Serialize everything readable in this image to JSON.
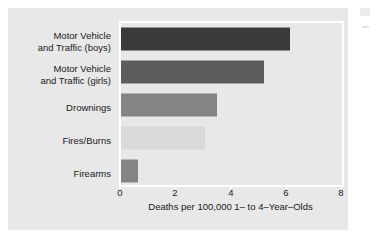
{
  "chart_data": {
    "type": "bar",
    "orientation": "horizontal",
    "title": "",
    "subtitle": "",
    "xlabel": "Deaths per 100,000 1– to 4–Year–Olds",
    "ylabel": "",
    "xlim": [
      0,
      8
    ],
    "xticks": [
      0,
      2,
      4,
      6,
      8
    ],
    "xtick_labels": [
      "0",
      "2",
      "4",
      "6",
      "8"
    ],
    "grid": false,
    "legend": false,
    "categories": [
      "Motor Vehicle\nand Traffic (boys)",
      "Motor Vehicle\nand Traffic (girls)",
      "Drownings",
      "Fires/Burns",
      "Firearms"
    ],
    "values": [
      6.0,
      5.1,
      3.4,
      3.0,
      0.6
    ],
    "bar_colors": [
      "#3a3a3a",
      "#5c5c5c",
      "#848484",
      "#d9d9d9",
      "#848484"
    ],
    "annotations": []
  },
  "figure": {
    "background_color": "#ffffff",
    "panel_color": "#e8e8e8",
    "axis_color": "#ffffff",
    "text_color": "#1a1a1a"
  }
}
